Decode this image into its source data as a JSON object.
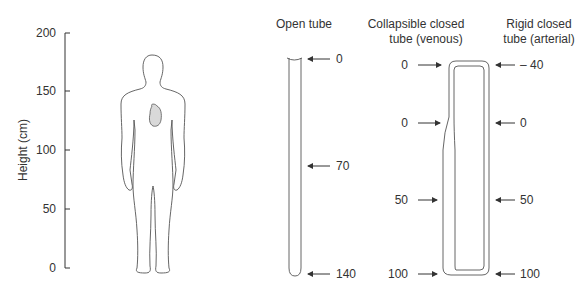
{
  "axis": {
    "label": "Height (cm)",
    "ticks": [
      "200",
      "150",
      "100",
      "50",
      "0"
    ]
  },
  "figure": {
    "body_icon": "human-body-silhouette",
    "heart_icon": "heart-shape"
  },
  "open_tube": {
    "title": "Open tube",
    "labels": [
      "0",
      "70",
      "140"
    ]
  },
  "collapsible_tube": {
    "title_line1": "Collapsible closed",
    "title_line2": "tube (venous)",
    "labels": [
      "0",
      "0",
      "50",
      "100"
    ]
  },
  "rigid_tube": {
    "title_line1": "Rigid closed",
    "title_line2": "tube (arterial)",
    "labels": [
      "– 40",
      "0",
      "50",
      "100"
    ]
  },
  "colors": {
    "line": "#333333",
    "heart_fill": "#d9d9d9"
  }
}
